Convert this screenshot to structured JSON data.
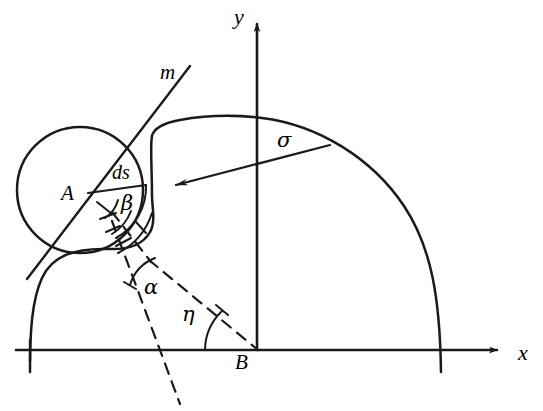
{
  "figure": {
    "type": "geometric-diagram",
    "stroke_color": "#1a1a1a",
    "background_color": "#ffffff",
    "width": 543,
    "height": 411
  },
  "axes": {
    "x_label": "x",
    "y_label": "y",
    "origin_label": "B",
    "x_axis": {
      "start_x": 16,
      "end_x": 500,
      "y": 350
    },
    "y_axis": {
      "x": 257,
      "start_y": 350,
      "end_y": 18
    }
  },
  "labels": {
    "line_m": "m",
    "point_a": "A",
    "point_b": "B",
    "arc_length": "ds",
    "angle_beta": "β",
    "angle_alpha": "α",
    "angle_eta": "η",
    "sigma": "σ",
    "axis_x": "x",
    "axis_y": "y"
  },
  "geometry": {
    "circle": {
      "cx": 80,
      "cy": 190,
      "r": 63
    },
    "point_a": {
      "x": 88,
      "y": 193
    },
    "point_b": {
      "x": 257,
      "y": 350
    },
    "line_m": {
      "x1": 28,
      "y1": 277,
      "x2": 188,
      "y2": 68
    },
    "chord_ds": {
      "x1": 88,
      "y1": 193,
      "x2": 143,
      "y2": 186
    },
    "tangent_point": {
      "x": 137,
      "y": 130
    },
    "sigma_arrow": {
      "tail_x": 327,
      "tail_y": 146,
      "head_x": 172,
      "head_y": 186
    },
    "alpha_vertex": {
      "x": 151,
      "y": 262
    },
    "dashed_vertical": {
      "x1": 114,
      "y1": 224,
      "x2": 178,
      "y2": 402
    },
    "dashed_to_origin": {
      "x1": 151,
      "y1": 262,
      "x2": 257,
      "y2": 350
    }
  },
  "label_positions": {
    "m": {
      "left": 160,
      "top": 62
    },
    "y": {
      "left": 235,
      "top": 8
    },
    "x": {
      "left": 518,
      "top": 344
    },
    "A": {
      "left": 62,
      "top": 184
    },
    "B": {
      "left": 236,
      "top": 352
    },
    "ds": {
      "left": 113,
      "top": 163
    },
    "beta": {
      "left": 122,
      "top": 194
    },
    "alpha": {
      "left": 143,
      "top": 278
    },
    "eta": {
      "left": 182,
      "top": 305
    },
    "sigma": {
      "left": 278,
      "top": 130
    }
  }
}
